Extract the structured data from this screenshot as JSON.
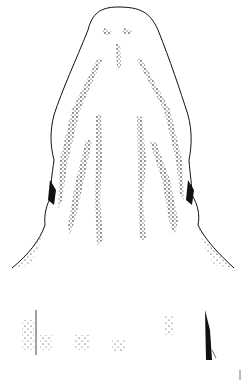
{
  "figure": {
    "background": "#ffffff",
    "ink": "#111111",
    "scale_mark": "|"
  }
}
